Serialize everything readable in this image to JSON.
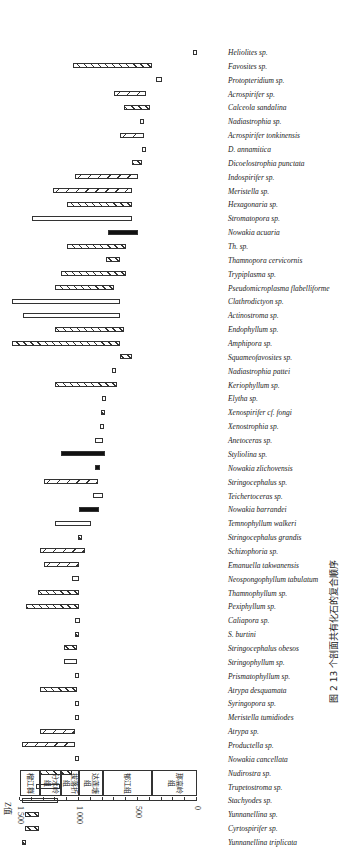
{
  "caption": "图 2  13 个剖面共有化石的复合顺序",
  "axis": {
    "label": "Z值",
    "ticks": [
      "1 500",
      "1 000",
      "500",
      "0"
    ]
  },
  "formations": [
    {
      "name": "榴江群",
      "from": 1500,
      "to": 1330
    },
    {
      "name": "分水岭组",
      "from": 1330,
      "to": 1150
    },
    {
      "name": "拔落折组",
      "from": 1150,
      "to": 1000
    },
    {
      "name": "达莲塘组",
      "from": 1000,
      "to": 800
    },
    {
      "name": "郁江组",
      "from": 800,
      "to": 380
    },
    {
      "name": "那高岭组",
      "from": 380,
      "to": 0
    }
  ],
  "chart_data": {
    "type": "bar",
    "title": "图 2  13 个剖面共有化石的复合顺序",
    "xlabel": "",
    "ylabel": "Z值",
    "ylim": [
      0,
      1500
    ],
    "orientation": "range bars (rotated)",
    "categories": [
      "Yunnanellina triplicata",
      "Cyrtospirifer sp.",
      "Yunnanellina sp.",
      "Stachyodes sp.",
      "Trupetostroma sp.",
      "Nudirostra sp.",
      "Nowakia cancellata",
      "Productella sp.",
      "Atrypa sp.",
      "Meristella tumidiodes",
      "Syringopora sp.",
      "Atrypa desquamata",
      "Prismatophyllum sp.",
      "Stringophyllum sp.",
      "Stringocephalus obesos",
      "S. burtini",
      "Caliapora sp.",
      "Pexiphyllum sp.",
      "Thamnophyllum sp.",
      "Neospongophyllum tabulatum",
      "Emanuella takwanensis",
      "Schizophoria sp.",
      "Stringocephalus grandis",
      "Temnophyllum walkeri",
      "Nowakia barrandei",
      "Teichertoceras sp.",
      "Stringocephalus sp.",
      "Nowakia zlichovensis",
      "Styliolina sp.",
      "Anetoceras sp.",
      "Xenostrophia sp.",
      "Xenospirifer cf. fongi",
      "Elytha sp.",
      "Keriophyllum sp.",
      "Nadiastrophia pattei",
      "Squameofavosites sp.",
      "Amphipora sp.",
      "Endophyllum sp.",
      "Actinostroma sp.",
      "Clathrodictyon sp.",
      "Pseudomicroplasma flabelliforme",
      "Trypiplasma sp.",
      "Thamnopora cervicornis",
      "Th. sp.",
      "Nowakia acuaria",
      "Stromatopora sp.",
      "Hexagonaria sp.",
      "Meristella sp.",
      "Indospirifer sp.",
      "Dicoelostrophia punctata",
      "D. annamitica",
      "Acrospirifer tonkinensis",
      "Nadiastrophia sp.",
      "Calceola sandalina",
      "Acrospirifer sp.",
      "Protopteridium sp.",
      "Favosites sp.",
      "Heliolites sp."
    ],
    "series": [
      {
        "name": "range_top",
        "values": [
          1480,
          1460,
          1460,
          1480,
          1360,
          1330,
          1030,
          1480,
          1330,
          1030,
          1030,
          1330,
          1030,
          1130,
          1130,
          1030,
          1030,
          1450,
          1350,
          1060,
          1300,
          1330,
          1010,
          1200,
          1000,
          880,
          1300,
          860,
          1150,
          860,
          800,
          800,
          790,
          1200,
          700,
          650,
          1570,
          1200,
          1470,
          1570,
          1200,
          1150,
          770,
          1100,
          750,
          1400,
          1100,
          1220,
          1030,
          550,
          450,
          650,
          470,
          620,
          700,
          350,
          1050,
          0
        ]
      },
      {
        "name": "range_bottom",
        "values": [
          1450,
          1340,
          1340,
          1180,
          1160,
          1060,
          1000,
          1030,
          1030,
          1000,
          1000,
          1020,
          1000,
          1020,
          1020,
          1000,
          990,
          1000,
          1000,
          1000,
          1000,
          950,
          970,
          900,
          830,
          800,
          840,
          820,
          780,
          800,
          790,
          780,
          770,
          680,
          690,
          550,
          650,
          620,
          650,
          650,
          700,
          600,
          650,
          600,
          500,
          550,
          550,
          550,
          500,
          470,
          430,
          450,
          450,
          400,
          430,
          300,
          380,
          20
        ]
      }
    ],
    "bar_fill_styles": [
      "hatched",
      "checkered",
      "solid",
      "open"
    ],
    "legend_position": "none",
    "grid": false
  }
}
